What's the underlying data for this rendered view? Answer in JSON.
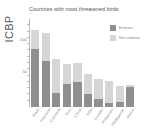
{
  "chart_data": {
    "type": "bar",
    "stacked": true,
    "title": "Countries with most threatened birds",
    "ylabel": "ICBP",
    "xlabel": "",
    "ylim": [
      0,
      140
    ],
    "yticks": [
      50,
      100
    ],
    "ytick_labels": [
      "50",
      "100"
    ],
    "grid": false,
    "legend_position": "top-right",
    "categories": [
      "Brazil",
      "Indonesia",
      "Colombia",
      "Peru",
      "China",
      "India",
      "Ecuador",
      "Philippines",
      "Madagascar",
      "Mexico"
    ],
    "series": [
      {
        "name": "Endemic",
        "color": "#8f8f8f",
        "values": [
          93,
          73,
          23,
          36,
          40,
          20,
          12,
          6,
          8,
          32
        ]
      },
      {
        "name": "Non-endemic",
        "color": "#d6d6d6",
        "values": [
          30,
          45,
          53,
          33,
          30,
          32,
          33,
          36,
          26,
          3
        ]
      }
    ],
    "totals": [
      123,
      118,
      76,
      69,
      70,
      52,
      45,
      42,
      34,
      35
    ]
  },
  "legend": {
    "items": [
      {
        "label": "Endemic",
        "color": "#8f8f8f",
        "swatch": "endemic-swatch"
      },
      {
        "label": "Non-endemic",
        "color": "#d6d6d6",
        "swatch": "nonendemic-swatch"
      }
    ]
  },
  "axis": {
    "y_title": "ICBP"
  },
  "theme": {
    "background": "#ffffff",
    "axis_color": "#b9b9b9",
    "text_color": "#8a8a8a",
    "title_color": "#555555",
    "series_dark": "#8f8f8f",
    "series_light": "#d6d6d6"
  }
}
